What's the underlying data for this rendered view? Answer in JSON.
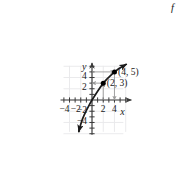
{
  "figure": {
    "kind": "coordinate-graph",
    "function_label": "f",
    "axis_labels": {
      "x": "x",
      "y": "y"
    },
    "colors": {
      "curve": "#1a1a1a",
      "axis": "#3a3a3a",
      "grid": "#e8e8ea",
      "guide": "#9a9a9a",
      "point": "#000000",
      "background": "#ffffff"
    }
  },
  "chart_data": {
    "type": "line",
    "title": "",
    "xlabel": "x",
    "ylabel": "y",
    "xlim": [
      -5.6,
      7.0
    ],
    "ylim": [
      -6.2,
      6.6
    ],
    "grid": true,
    "grid_step": 2,
    "legend": "none",
    "series": [
      {
        "name": "f",
        "x": [
          -2.35,
          -2.2,
          -2.0,
          -1.7,
          -1.4,
          -1.0,
          -0.6,
          -0.2,
          0.0,
          0.4,
          1.0,
          1.6,
          2.0,
          2.6,
          3.2,
          4.0,
          4.8,
          5.5,
          6.1
        ],
        "y": [
          -5.6,
          -5.0,
          -4.3,
          -3.4,
          -2.7,
          -1.85,
          -1.1,
          -0.35,
          0.0,
          0.62,
          1.55,
          2.45,
          3.0,
          3.68,
          4.25,
          5.0,
          5.6,
          6.0,
          6.35
        ]
      }
    ],
    "xticks": [
      -4,
      -2,
      2,
      4
    ],
    "xtick_labels": [
      "−4",
      "−2",
      "2",
      "4"
    ],
    "yticks": [
      -4,
      -2,
      2,
      4
    ],
    "ytick_labels": [
      "−4",
      "−2",
      "2",
      "4"
    ],
    "points": [
      {
        "label": "(2, 3)",
        "x": 2,
        "y": 3
      },
      {
        "label": "(4, 5)",
        "x": 4,
        "y": 5
      }
    ],
    "annotations": [
      {
        "name": "guide-h-4-5",
        "from": [
          0,
          5
        ],
        "to": [
          4,
          5
        ],
        "arrow": "to-point"
      },
      {
        "name": "guide-v-4-5",
        "from": [
          4,
          5
        ],
        "to": [
          4,
          0
        ],
        "arrow": "to-axis"
      },
      {
        "name": "guide-h-2-3",
        "from": [
          2,
          3
        ],
        "to": [
          0,
          3
        ],
        "arrow": "to-axis"
      },
      {
        "name": "guide-v-2-3",
        "from": [
          2,
          0
        ],
        "to": [
          2,
          3
        ],
        "arrow": "to-point"
      }
    ]
  }
}
